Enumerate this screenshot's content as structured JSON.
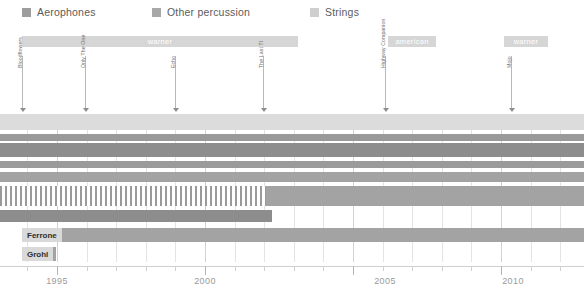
{
  "legend": {
    "items": [
      {
        "label": "Aerophones",
        "color": "#9d9d9d",
        "x": 22
      },
      {
        "label": "Other percussion",
        "color": "#a8a8a8",
        "x": 152
      },
      {
        "label": "Strings",
        "color": "#cfcfcf",
        "x": 310
      }
    ]
  },
  "eras": [
    {
      "label": "warner",
      "x": 22,
      "width": 276,
      "color": "#d6d6d6"
    },
    {
      "label": "american",
      "x": 388,
      "width": 48,
      "color": "#d6d6d6"
    },
    {
      "label": "warner",
      "x": 504,
      "width": 44,
      "color": "#d6d6d6"
    }
  ],
  "events": [
    {
      "label": "Bloodflowers",
      "x": 22
    },
    {
      "label": "Only The One",
      "x": 85
    },
    {
      "label": "Echo",
      "x": 175
    },
    {
      "label": "The Last TI",
      "x": 263
    },
    {
      "label": "Highway Companion",
      "x": 385
    },
    {
      "label": "Mojo",
      "x": 511
    }
  ],
  "chart_data": {
    "type": "bar",
    "title": "",
    "xlabel": "",
    "ylabel": "",
    "orientation": "horizontal-timeline",
    "grid": true,
    "legend_position": "top-left",
    "xlim": [
      1992.2,
      2012.1
    ],
    "xticks": [
      1995,
      2000,
      2005,
      2010
    ],
    "xtick_labels": [
      "1995",
      "2000",
      "2005",
      "2010"
    ],
    "minor_tick_step": 1,
    "categories": [
      "Strings band",
      "Aerophones A",
      "Other percussion A",
      "Aerophones B",
      "Other percussion B",
      "Hatched percussion",
      "Percussion run",
      "Ferrone",
      "Grohl"
    ],
    "bars": [
      {
        "name": "Strings band",
        "start_px": 0,
        "end_px": 584,
        "color": "#dcdcdc",
        "hatched": false,
        "tag": ""
      },
      {
        "name": "Aerophones A",
        "start_px": 0,
        "end_px": 584,
        "color": "#9a9a9a",
        "hatched": false,
        "tag": ""
      },
      {
        "name": "Other percussion A",
        "start_px": 0,
        "end_px": 584,
        "color": "#8d8d8d",
        "hatched": false,
        "tag": ""
      },
      {
        "name": "Aerophones B",
        "start_px": 0,
        "end_px": 584,
        "color": "#9a9a9a",
        "hatched": false,
        "tag": ""
      },
      {
        "name": "Other percussion B",
        "start_px": 0,
        "end_px": 584,
        "color": "#a3a3a3",
        "hatched": false,
        "tag": ""
      },
      {
        "name": "Hatched percussion",
        "start_px": 0,
        "end_px": 266,
        "color": "#9a9a9a",
        "hatched": true,
        "tag": ""
      },
      {
        "name": "Hatched tail",
        "start_px": 266,
        "end_px": 584,
        "color": "#a3a3a3",
        "hatched": false,
        "tag": ""
      },
      {
        "name": "Percussion run",
        "start_px": 0,
        "end_px": 272,
        "color": "#8d8d8d",
        "hatched": false,
        "tag": ""
      },
      {
        "name": "Ferrone",
        "start_px": 22,
        "end_px": 584,
        "color": "#a3a3a3",
        "hatched": false,
        "tag": "Ferrone"
      },
      {
        "name": "Grohl",
        "start_px": 22,
        "end_px": 56,
        "color": "#a3a3a3",
        "hatched": false,
        "tag": "Grohl"
      }
    ]
  },
  "axis": {
    "years": [
      {
        "label": "1995",
        "x": 57
      },
      {
        "label": "2000",
        "x": 205
      },
      {
        "label": "2005",
        "x": 385
      },
      {
        "label": "2010",
        "x": 513
      }
    ]
  }
}
